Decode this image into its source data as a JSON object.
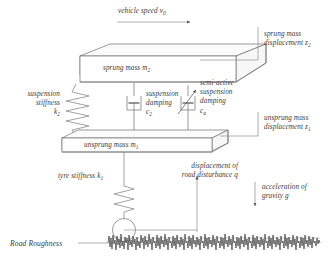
{
  "figure": {
    "type": "quarter-car suspension model diagram",
    "labels": {
      "vehicle_speed": "vehicle speed v",
      "vehicle_speed_sub": "0",
      "sprung_displacement_l1": "sprung mass",
      "sprung_displacement_l2": "displacement z",
      "sprung_displacement_sub": "2",
      "sprung_mass": "sprung mass m",
      "sprung_mass_sub": "2",
      "suspension_stiffness_l1": "suspension",
      "suspension_stiffness_l2": "stiffness",
      "suspension_stiffness_l3": "k",
      "suspension_stiffness_sub": "2",
      "suspension_damping_l1": "suspension",
      "suspension_damping_l2": "damping",
      "suspension_damping_l3": "c",
      "suspension_damping_sub": "2",
      "semiactive_l1": "semi-active",
      "semiactive_l2": "suspension",
      "semiactive_l3": "damping",
      "semiactive_l4": "c",
      "semiactive_sub": "a",
      "unsprung_displacement_l1": "unsprung mass",
      "unsprung_displacement_l2": "displacement z",
      "unsprung_displacement_sub": "1",
      "unsprung_mass": "unsprung mass m",
      "unsprung_mass_sub": "1",
      "tyre_stiffness": "tyre stiffness k",
      "tyre_stiffness_sub": "1",
      "road_disturbance_l1": "displacement of",
      "road_disturbance_l2": "road disturbance q",
      "gravity_l1": "acceleration of",
      "gravity_l2": "gravity g",
      "road_roughness": "Road Roughness"
    },
    "colors": {
      "line": "#6f6f6f",
      "text": "#3a3a3a",
      "road": "#3f3f3f",
      "background": "#ffffff"
    }
  }
}
